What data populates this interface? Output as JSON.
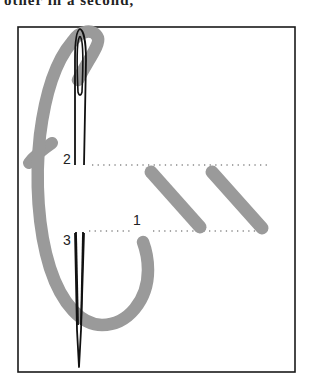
{
  "caption_fragment": "other in a second, ",
  "figure": {
    "labels": [
      {
        "id": "1",
        "text": "1"
      },
      {
        "id": "2",
        "text": "2"
      },
      {
        "id": "3",
        "text": "3"
      }
    ],
    "colors": {
      "frame": "#1a1a1a",
      "needle": "#111111",
      "thread": "#9a9a9a",
      "guide_dots": "#8a8a8a",
      "background": "#ffffff"
    },
    "elements": [
      "frame",
      "needle",
      "thread-loop",
      "guide-line-upper",
      "guide-line-lower",
      "stitch-1",
      "stitch-2"
    ]
  }
}
